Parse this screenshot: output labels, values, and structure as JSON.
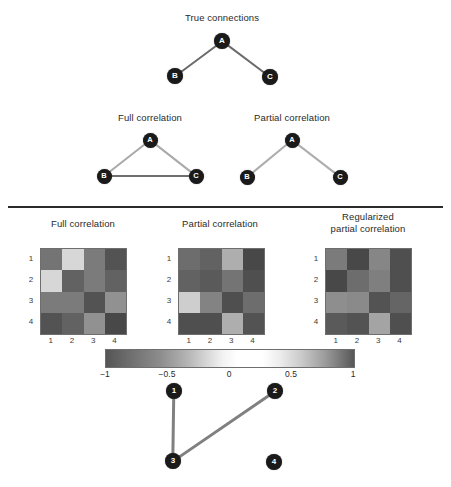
{
  "figure": {
    "panels": {
      "top": {
        "title": "True connections",
        "graph": {
          "nodes": [
            {
              "id": "A",
              "label": "A",
              "x": 222,
              "y": 41
            },
            {
              "id": "B",
              "label": "B",
              "x": 175,
              "y": 76
            },
            {
              "id": "C",
              "label": "C",
              "x": 270,
              "y": 77
            }
          ],
          "edges": [
            {
              "from": "A",
              "to": "B",
              "color": "#6b6b6b",
              "width": 2.4
            },
            {
              "from": "A",
              "to": "C",
              "color": "#6b6b6b",
              "width": 2.4
            }
          ]
        }
      },
      "middle_left": {
        "title": "Full correlation",
        "graph": {
          "nodes": [
            {
              "id": "A",
              "label": "A",
              "x": 150,
              "y": 140
            },
            {
              "id": "B",
              "label": "B",
              "x": 104,
              "y": 176
            },
            {
              "id": "C",
              "label": "C",
              "x": 196,
              "y": 176
            }
          ],
          "edges": [
            {
              "from": "A",
              "to": "B",
              "color": "#a9a9a9",
              "width": 2.2
            },
            {
              "from": "A",
              "to": "C",
              "color": "#a9a9a9",
              "width": 2.2
            },
            {
              "from": "B",
              "to": "C",
              "color": "#6f6f6f",
              "width": 2.6
            }
          ]
        }
      },
      "middle_right": {
        "title": "Partial correlation",
        "graph": {
          "nodes": [
            {
              "id": "A",
              "label": "A",
              "x": 292,
              "y": 140
            },
            {
              "id": "B",
              "label": "B",
              "x": 247,
              "y": 177
            },
            {
              "id": "C",
              "label": "C",
              "x": 340,
              "y": 177
            }
          ],
          "edges": [
            {
              "from": "A",
              "to": "B",
              "color": "#adadad",
              "width": 2.2
            },
            {
              "from": "A",
              "to": "C",
              "color": "#adadad",
              "width": 2.2
            }
          ]
        }
      },
      "bottom": {
        "graph": {
          "nodes": [
            {
              "id": "1",
              "label": "1",
              "x": 174,
              "y": 391
            },
            {
              "id": "2",
              "label": "2",
              "x": 275,
              "y": 391
            },
            {
              "id": "3",
              "label": "3",
              "x": 173,
              "y": 461
            },
            {
              "id": "4",
              "label": "4",
              "x": 274,
              "y": 462
            }
          ],
          "edges": [
            {
              "from": "1",
              "to": "3",
              "color": "#808080",
              "width": 2.6
            },
            {
              "from": "2",
              "to": "3",
              "color": "#808080",
              "width": 2.8
            }
          ]
        }
      }
    },
    "matrix_titles": {
      "full": "Full correlation",
      "partial": "Partial correlation",
      "regularized": "Regularized\npartial correlation"
    },
    "axis_ticks": [
      "1",
      "2",
      "3",
      "4"
    ],
    "colorbar": {
      "ticks": [
        "−1",
        "−0.5",
        "0",
        "0.5",
        "1"
      ],
      "min": -1,
      "max": 1
    }
  },
  "chart_data": [
    {
      "type": "heatmap",
      "title": "Full correlation",
      "xlabel": "",
      "ylabel": "",
      "x_ticklabels": [
        "1",
        "2",
        "3",
        "4"
      ],
      "y_ticklabels": [
        "1",
        "2",
        "3",
        "4"
      ],
      "zlim": [
        -1,
        1
      ],
      "colormap": "gray",
      "grid": false,
      "values": [
        [
          0.88,
          -0.22,
          -0.72,
          0.97
        ],
        [
          -0.22,
          0.93,
          -0.72,
          0.93
        ],
        [
          -0.72,
          -0.72,
          0.97,
          0.8
        ],
        [
          0.97,
          0.93,
          0.8,
          1.0
        ]
      ]
    },
    {
      "type": "heatmap",
      "title": "Partial correlation",
      "xlabel": "",
      "ylabel": "",
      "x_ticklabels": [
        "1",
        "2",
        "3",
        "4"
      ],
      "y_ticklabels": [
        "1",
        "2",
        "3",
        "4"
      ],
      "zlim": [
        -1,
        1
      ],
      "colormap": "gray",
      "grid": false,
      "values": [
        [
          0.9,
          0.93,
          -0.44,
          1.0
        ],
        [
          0.93,
          0.95,
          -0.76,
          0.98
        ],
        [
          -0.27,
          -0.68,
          0.98,
          0.9
        ],
        [
          0.98,
          0.98,
          0.72,
          0.97
        ]
      ]
    },
    {
      "type": "heatmap",
      "title": "Regularized partial correlation",
      "xlabel": "",
      "ylabel": "",
      "x_ticklabels": [
        "1",
        "2",
        "3",
        "4"
      ],
      "y_ticklabels": [
        "1",
        "2",
        "3",
        "4"
      ],
      "zlim": [
        -1,
        1
      ],
      "colormap": "gray",
      "grid": false,
      "values": [
        [
          0.86,
          1.0,
          -0.66,
          0.98
        ],
        [
          1.0,
          0.9,
          -0.7,
          0.98
        ],
        [
          -0.62,
          -0.64,
          0.97,
          0.92
        ],
        [
          0.95,
          0.97,
          0.75,
          0.98
        ]
      ]
    }
  ],
  "matrix_layout": [
    {
      "key": "full",
      "left": 40,
      "top": 248,
      "size": 85
    },
    {
      "key": "partial",
      "left": 178,
      "top": 248,
      "size": 85
    },
    {
      "key": "regularized",
      "left": 325,
      "top": 248,
      "size": 85
    }
  ]
}
